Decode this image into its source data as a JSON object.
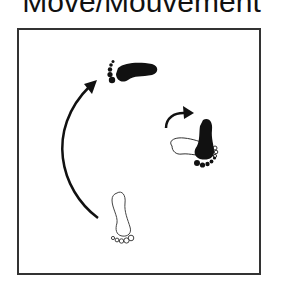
{
  "title": "Move/Mouvement",
  "colors": {
    "ink": "#111111",
    "frame": "#333333",
    "background": "#ffffff"
  },
  "icons": [
    "foot-outline-start-icon",
    "large-curved-arrow-icon",
    "foot-filled-left-icon",
    "small-curved-arrow-icon",
    "foot-outline-horizontal-icon",
    "foot-filled-down-icon"
  ]
}
